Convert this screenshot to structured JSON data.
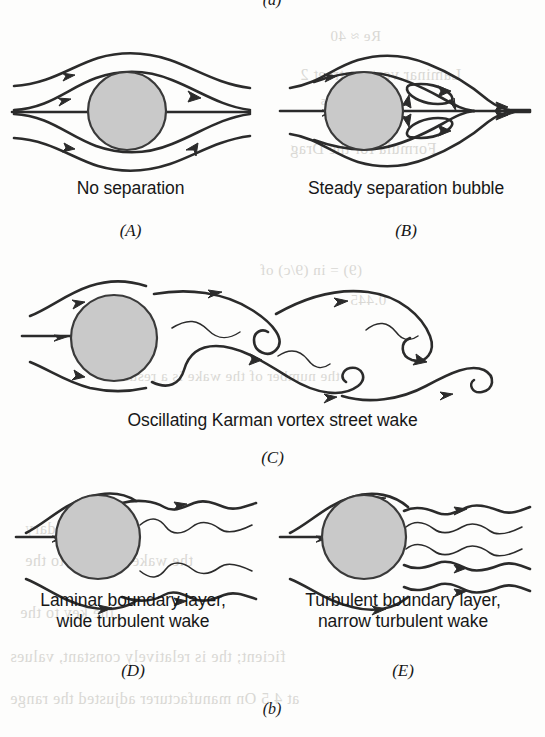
{
  "figure": {
    "top_group_label": "(a)",
    "bottom_group_label": "(b)",
    "stroke_color": "#2b2b2b",
    "body_fill_color": "#c9c9c9",
    "body_stroke_color": "#3a3a3a",
    "page_background": "#fdfdfc",
    "bleed_text_color": "#d9d8d4"
  },
  "panels": [
    {
      "id": "A",
      "letter": "(A)",
      "caption": "No separation",
      "regime": "attached-laminar-flow",
      "streamlines": 5,
      "has_wake": false
    },
    {
      "id": "B",
      "letter": "(B)",
      "caption": "Steady separation bubble",
      "regime": "steady-separation-bubble",
      "streamlines": 5,
      "has_wake": true,
      "recirculation_vortices": 2
    },
    {
      "id": "C",
      "letter": "(C)",
      "caption": "Oscillating Karman vortex street wake",
      "regime": "karman-vortex-street",
      "streamlines": 3,
      "has_wake": true,
      "vortices": 4
    },
    {
      "id": "D",
      "letter": "(D)",
      "caption": "Laminar boundary layer,\nwide turbulent wake",
      "regime": "laminar-boundary-layer-wide-wake",
      "streamlines": 3,
      "has_wake": true,
      "wake_filaments": 4
    },
    {
      "id": "E",
      "letter": "(E)",
      "caption": "Turbulent boundary layer,\nnarrow turbulent wake",
      "regime": "turbulent-boundary-layer-narrow-wake",
      "streamlines": 3,
      "has_wake": true,
      "wake_filaments": 5
    }
  ],
  "bleed_through_lines": [
    {
      "text": "Re ≈ 40",
      "x": 330,
      "y": 28,
      "size": 15
    },
    {
      "text": "Laminar vortex street 2",
      "x": 300,
      "y": 66,
      "size": 16
    },
    {
      "text": "1 × 10⁵",
      "x": 320,
      "y": 96,
      "size": 15
    },
    {
      "text": "Formula for the Drag",
      "x": 290,
      "y": 140,
      "size": 16
    },
    {
      "text": "(9) =  in  (9/c)  of",
      "x": 260,
      "y": 262,
      "size": 15
    },
    {
      "text": "0.445",
      "x": 350,
      "y": 292,
      "size": 15
    },
    {
      "text": "the number of the wake is a result",
      "x": 120,
      "y": 368,
      "size": 15
    },
    {
      "text": "the boundary",
      "x": 25,
      "y": 520,
      "size": 16
    },
    {
      "text": "the wake weakens to the",
      "x": 25,
      "y": 552,
      "size": 16
    },
    {
      "text": "the key to the",
      "x": 20,
      "y": 604,
      "size": 16
    },
    {
      "text": "ficient; the is relatively constant,    values",
      "x": 10,
      "y": 648,
      "size": 16
    },
    {
      "text": "at 4.5 On manufacturer adjusted the range",
      "x": 10,
      "y": 690,
      "size": 16
    }
  ]
}
